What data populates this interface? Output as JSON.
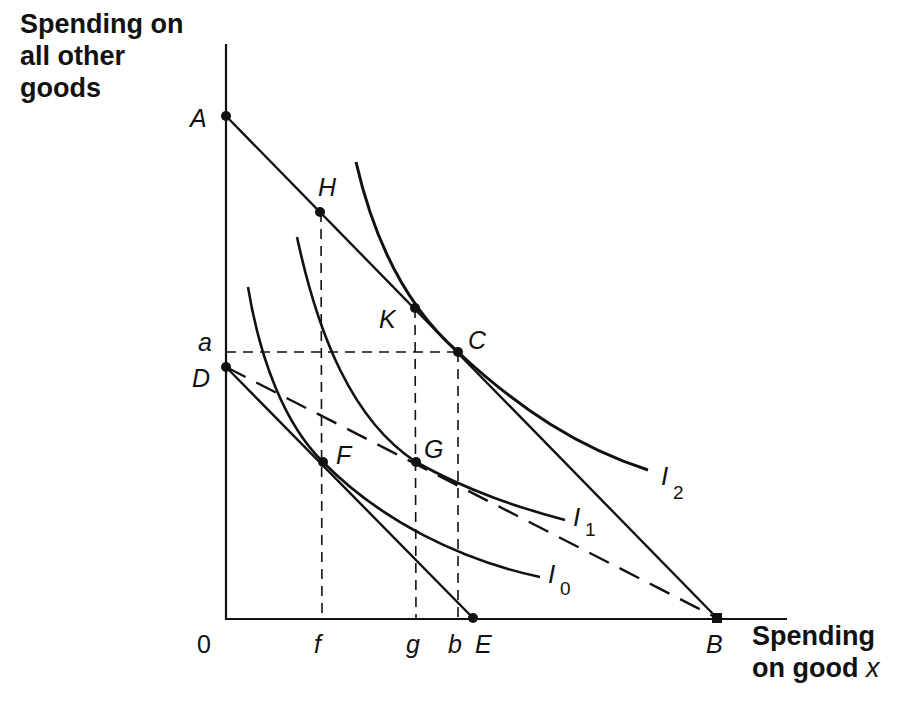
{
  "diagram": {
    "type": "indifference-curve-budget-constraint",
    "y_axis_title": "Spending on\nall other\ngoods",
    "x_axis_title_main": "Spending\non good ",
    "x_axis_title_var": "x",
    "origin_label": "0",
    "colors": {
      "ink": "#111111",
      "background": "#ffffff"
    },
    "points": {
      "A": "A",
      "H": "H",
      "K": "K",
      "C": "C",
      "D": "D",
      "F": "F",
      "G": "G",
      "E": "E",
      "B": "B"
    },
    "axis_ticks": {
      "y": [
        "a"
      ],
      "x": [
        "f",
        "g",
        "b"
      ]
    },
    "curves": [
      {
        "name": "I",
        "sub": "2",
        "description": "highest indifference curve, tangent to budget line AB at C"
      },
      {
        "name": "I",
        "sub": "1",
        "description": "middle indifference curve, passing through G on dashed line DB"
      },
      {
        "name": "I",
        "sub": "0",
        "description": "lowest indifference curve, tangent to budget line DE at F"
      }
    ],
    "lines": [
      {
        "id": "AB",
        "style": "solid",
        "from": "A",
        "to": "B",
        "description": "original budget line"
      },
      {
        "id": "DE",
        "style": "solid",
        "from": "D",
        "to": "E",
        "description": "budget line after change"
      },
      {
        "id": "DB",
        "style": "dashed",
        "from": "D",
        "to": "B",
        "description": "alternative budget line"
      },
      {
        "id": "aC",
        "style": "dashed",
        "from": "a",
        "to": "C"
      },
      {
        "id": "fH",
        "style": "dashed",
        "from": "f",
        "to": "H"
      },
      {
        "id": "gK",
        "style": "dashed",
        "from": "g",
        "to": "K"
      },
      {
        "id": "bC",
        "style": "dashed",
        "from": "b",
        "to": "C"
      }
    ]
  }
}
